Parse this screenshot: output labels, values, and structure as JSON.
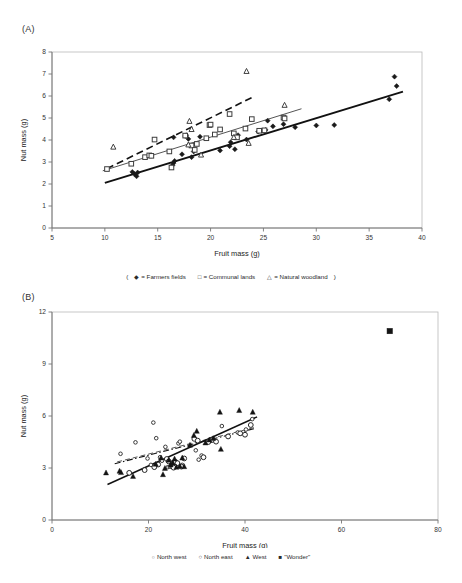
{
  "figure": {
    "panels": [
      {
        "id": "A",
        "label": "(A)",
        "legend_open_paren": "(",
        "legend_close_paren": ")",
        "legend": [
          {
            "symbol": "diamond",
            "marker": "◆",
            "label": "= Farmers fields",
            "name": "farmers-fields"
          },
          {
            "symbol": "square-open",
            "marker": "□",
            "label": "= Communal lands",
            "name": "communal-lands"
          },
          {
            "symbol": "triangle-open",
            "marker": "△",
            "label": "= Natural woodland",
            "name": "natural-woodland"
          }
        ]
      },
      {
        "id": "B",
        "label": "(B)",
        "legend_open_paren": "",
        "legend_close_paren": "",
        "legend": [
          {
            "symbol": "circle-open-small",
            "marker": "○",
            "label": "North west",
            "name": "north-west"
          },
          {
            "symbol": "circle-open",
            "marker": "○",
            "label": "North east",
            "name": "north-east"
          },
          {
            "symbol": "triangle-filled",
            "marker": "▲",
            "label": "West",
            "name": "west"
          },
          {
            "symbol": "square-filled",
            "marker": "■",
            "label": "\"Wonder\"",
            "name": "wonder"
          }
        ]
      }
    ]
  },
  "chart_data": [
    {
      "panel": "A",
      "type": "scatter",
      "title": "",
      "xlabel": "Fruit mass (g)",
      "ylabel": "Nut mass (g)",
      "xlim": [
        5,
        40
      ],
      "ylim": [
        0,
        8
      ],
      "xticks": [
        5,
        10,
        15,
        20,
        25,
        30,
        35,
        40
      ],
      "yticks": [
        0,
        1,
        2,
        3,
        4,
        5,
        6,
        7,
        8
      ],
      "grid": false,
      "legend_position": "below",
      "series": [
        {
          "name": "Farmers fields",
          "marker": "filled-diamond",
          "color": "#1a1a1a",
          "points": [
            [
              12.6,
              2.55
            ],
            [
              12.8,
              2.45
            ],
            [
              13.0,
              2.35
            ],
            [
              13.1,
              2.52
            ],
            [
              16.4,
              2.85
            ],
            [
              16.5,
              2.95
            ],
            [
              16.6,
              3.05
            ],
            [
              16.5,
              4.12
            ],
            [
              17.3,
              3.35
            ],
            [
              17.6,
              4.18
            ],
            [
              17.7,
              4.22
            ],
            [
              17.9,
              4.05
            ],
            [
              18.2,
              3.22
            ],
            [
              18.4,
              3.48
            ],
            [
              19.0,
              4.15
            ],
            [
              20.9,
              3.52
            ],
            [
              21.8,
              3.72
            ],
            [
              21.9,
              3.9
            ],
            [
              22.3,
              3.58
            ],
            [
              22.6,
              4.22
            ],
            [
              23.4,
              4.02
            ],
            [
              24.5,
              4.38
            ],
            [
              25.2,
              4.46
            ],
            [
              25.4,
              4.88
            ],
            [
              25.9,
              4.62
            ],
            [
              26.9,
              4.72
            ],
            [
              28.0,
              4.58
            ],
            [
              30.0,
              4.66
            ],
            [
              31.7,
              4.68
            ],
            [
              36.9,
              5.85
            ],
            [
              37.4,
              6.88
            ],
            [
              37.6,
              6.45
            ]
          ],
          "fit": {
            "x0": 10.0,
            "y0": 2.05,
            "x1": 38.2,
            "y1": 6.2,
            "style": "solid-thick",
            "lw": 1.9
          }
        },
        {
          "name": "Communal lands",
          "marker": "open-square",
          "color": "#4a4a4a",
          "points": [
            [
              10.2,
              2.68
            ],
            [
              12.5,
              2.92
            ],
            [
              13.8,
              3.22
            ],
            [
              14.2,
              3.3
            ],
            [
              14.4,
              3.28
            ],
            [
              14.7,
              4.02
            ],
            [
              16.1,
              3.48
            ],
            [
              16.3,
              2.75
            ],
            [
              17.6,
              4.2
            ],
            [
              18.2,
              3.75
            ],
            [
              18.5,
              3.55
            ],
            [
              18.7,
              3.82
            ],
            [
              19.6,
              4.08
            ],
            [
              19.9,
              4.68
            ],
            [
              20.0,
              4.7
            ],
            [
              20.4,
              4.25
            ],
            [
              20.9,
              4.48
            ],
            [
              21.8,
              5.18
            ],
            [
              22.2,
              4.3
            ],
            [
              22.5,
              4.12
            ],
            [
              23.3,
              4.52
            ],
            [
              23.9,
              4.95
            ],
            [
              24.6,
              4.42
            ],
            [
              25.1,
              4.44
            ],
            [
              26.9,
              5.02
            ],
            [
              27.0,
              4.98
            ]
          ],
          "fit": {
            "x0": 9.8,
            "y0": 2.6,
            "x1": 28.6,
            "y1": 5.42,
            "style": "solid-thin",
            "lw": 1.0
          }
        },
        {
          "name": "Natural woodland",
          "marker": "open-triangle",
          "color": "#3a3a3a",
          "points": [
            [
              10.8,
              3.68
            ],
            [
              17.9,
              3.78
            ],
            [
              18.0,
              4.85
            ],
            [
              18.2,
              4.48
            ],
            [
              19.1,
              3.32
            ],
            [
              22.2,
              4.12
            ],
            [
              23.4,
              7.12
            ],
            [
              23.6,
              3.85
            ],
            [
              27.0,
              5.58
            ]
          ],
          "fit": {
            "x0": 10.2,
            "y0": 2.7,
            "x1": 24.0,
            "y1": 5.95,
            "style": "dashed",
            "lw": 1.6
          }
        }
      ]
    },
    {
      "panel": "B",
      "type": "scatter",
      "title": "",
      "xlabel": "Fruit mass (g)",
      "ylabel": "Nut mass (g)",
      "xlim": [
        0,
        80
      ],
      "ylim": [
        0,
        12
      ],
      "xticks": [
        0,
        20,
        40,
        60,
        80
      ],
      "yticks": [
        0,
        3,
        6,
        9,
        12
      ],
      "grid": false,
      "legend_position": "below",
      "series": [
        {
          "name": "North west",
          "marker": "open-circle-small",
          "color": "#2a2a2a",
          "points": [
            [
              14.2,
              3.82
            ],
            [
              17.3,
              4.48
            ],
            [
              19.8,
              3.55
            ],
            [
              20.5,
              3.18
            ],
            [
              21.0,
              5.62
            ],
            [
              21.6,
              4.72
            ],
            [
              22.4,
              3.62
            ],
            [
              22.8,
              3.42
            ],
            [
              23.5,
              4.22
            ],
            [
              24.0,
              3.05
            ],
            [
              24.4,
              3.08
            ],
            [
              25.0,
              3.32
            ],
            [
              25.4,
              3.38
            ],
            [
              26.2,
              4.42
            ],
            [
              26.5,
              4.52
            ],
            [
              27.0,
              3.18
            ],
            [
              29.8,
              4.02
            ],
            [
              30.4,
              3.48
            ],
            [
              31.0,
              3.72
            ],
            [
              33.0,
              4.58
            ],
            [
              35.2,
              5.42
            ],
            [
              38.5,
              5.05
            ],
            [
              40.2,
              5.22
            ],
            [
              41.5,
              5.82
            ]
          ],
          "fit": {
            "x0": 13.0,
            "y0": 3.25,
            "x1": 42.0,
            "y1": 5.28,
            "style": "dash-dot",
            "lw": 1.1
          }
        },
        {
          "name": "North east",
          "marker": "open-circle",
          "color": "#2a2a2a",
          "points": [
            [
              16.0,
              2.72
            ],
            [
              19.2,
              2.88
            ],
            [
              21.2,
              3.05
            ],
            [
              22.0,
              3.2
            ],
            [
              23.8,
              3.52
            ],
            [
              24.2,
              3.38
            ],
            [
              24.8,
              3.12
            ],
            [
              25.2,
              3.02
            ],
            [
              25.6,
              3.35
            ],
            [
              26.0,
              3.28
            ],
            [
              26.8,
              3.08
            ],
            [
              27.4,
              3.55
            ],
            [
              29.5,
              4.68
            ],
            [
              30.2,
              4.58
            ],
            [
              31.4,
              3.62
            ],
            [
              32.4,
              4.5
            ],
            [
              33.2,
              4.62
            ],
            [
              34.0,
              4.52
            ],
            [
              36.5,
              4.82
            ],
            [
              39.0,
              5.0
            ],
            [
              40.0,
              4.92
            ],
            [
              41.2,
              5.48
            ]
          ],
          "fit": {
            "x0": 13.5,
            "y0": 3.35,
            "x1": 42.2,
            "y1": 5.35,
            "style": "dashed-thin",
            "lw": 1.0
          }
        },
        {
          "name": "West",
          "marker": "filled-triangle",
          "color": "#141414",
          "points": [
            [
              11.2,
              2.72
            ],
            [
              14.0,
              2.82
            ],
            [
              14.3,
              2.74
            ],
            [
              16.8,
              2.52
            ],
            [
              21.5,
              3.22
            ],
            [
              22.6,
              3.58
            ],
            [
              23.0,
              2.62
            ],
            [
              23.4,
              2.98
            ],
            [
              24.2,
              3.45
            ],
            [
              24.6,
              3.18
            ],
            [
              25.0,
              3.3
            ],
            [
              25.4,
              3.52
            ],
            [
              25.8,
              3.05
            ],
            [
              26.5,
              3.1
            ],
            [
              27.0,
              3.58
            ],
            [
              27.4,
              3.08
            ],
            [
              28.6,
              4.32
            ],
            [
              29.4,
              4.88
            ],
            [
              30.0,
              5.12
            ],
            [
              31.8,
              4.45
            ],
            [
              32.6,
              4.62
            ],
            [
              33.4,
              4.7
            ],
            [
              34.8,
              6.22
            ],
            [
              35.0,
              4.08
            ],
            [
              38.8,
              6.32
            ],
            [
              41.6,
              6.22
            ]
          ],
          "fit": {
            "x0": 11.5,
            "y0": 2.05,
            "x1": 42.5,
            "y1": 5.95,
            "style": "solid",
            "lw": 1.5
          }
        },
        {
          "name": "\"Wonder\"",
          "marker": "filled-square",
          "color": "#141414",
          "points": [
            [
              70.0,
              10.9
            ]
          ],
          "fit": null
        }
      ]
    }
  ]
}
